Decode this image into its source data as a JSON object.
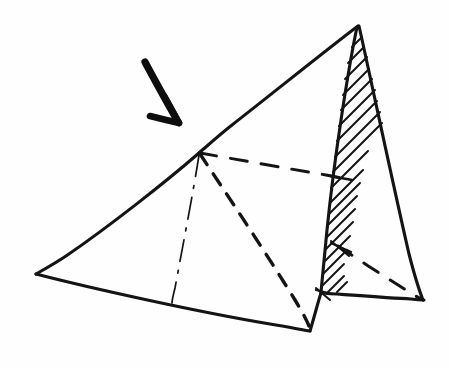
{
  "figure": {
    "background_color": "#fefefe",
    "ink_color": "#141414",
    "width": 449,
    "height": 368,
    "caption": "",
    "annotation_arrow": {
      "name": "pointer-arrow",
      "description": "thick hand-drawn arrow pointing down-right toward the pyramid apex edge",
      "tail_x": 145,
      "tail_y": 62,
      "tip_x": 180,
      "tip_y": 124
    },
    "vertices": {
      "apex": {
        "label": "apex",
        "x": 358,
        "y": 25
      },
      "left": {
        "label": "left-base-corner",
        "x": 36,
        "y": 274
      },
      "front": {
        "label": "front-base-corner",
        "x": 310,
        "y": 331
      },
      "right": {
        "label": "right-base-corner",
        "x": 424,
        "y": 300
      },
      "cut": {
        "label": "cut-point-on-front-edge",
        "x": 199,
        "y": 153
      },
      "hatch_base_left": {
        "label": "hatch-base-left",
        "x": 322,
        "y": 292
      },
      "hatch_mid": {
        "label": "hatch-mid-point",
        "x": 340,
        "y": 247
      }
    },
    "strokes": {
      "solid_edges": [
        {
          "name": "edge-apex-to-cut",
          "d": "M 358 26 C 330 47, 268 97, 232 125 C 218 136, 206 147, 199 153"
        },
        {
          "name": "edge-cut-to-left-base",
          "d": "M 199 153 C 168 180, 110 226, 66 256 C 54 264, 43 270, 36 274"
        },
        {
          "name": "edge-left-base-to-front-base",
          "d": "M 36 274 C 90 288, 198 312, 270 324 C 290 327, 302 330, 310 331"
        },
        {
          "name": "edge-front-base-up-right",
          "d": "M 310 331 C 314 318, 318 302, 321 293"
        },
        {
          "name": "edge-hatch-left-boundary",
          "d": "M 357 27 C 348 70, 334 160, 327 230 C 324 262, 322 283, 321 292"
        },
        {
          "name": "edge-apex-to-right-base",
          "d": "M 359 26 C 368 66, 392 180, 409 254 C 417 285, 421 295, 423 300"
        },
        {
          "name": "edge-base-right-face",
          "d": "M 321 293 C 350 295, 390 298, 411 299 C 418 300, 421 300, 424 300"
        }
      ],
      "dashed_edges": [
        {
          "name": "dashed-cut-plane-horizontal",
          "d": "M 200 153 C 240 160, 290 169, 326 175 C 336 177, 342 178, 348 179",
          "style": "edge-dashed-light"
        },
        {
          "name": "dashed-cut-plane-diagonal",
          "d": "M 200 154 C 226 193, 268 256, 295 300 C 303 313, 307 321, 309 326",
          "style": "edge-dashed"
        },
        {
          "name": "dashed-base-diagonal-right",
          "d": "M 338 246 C 362 262, 396 284, 414 295 C 419 298, 421 299, 423 300",
          "style": "edge-dashed-light"
        }
      ],
      "dashdot_edges": [
        {
          "name": "dashdot-internal-height",
          "d": "M 199 155 C 194 188, 182 250, 175 288 C 173 296, 172 300, 172 303",
          "style": "edge-dashdot"
        }
      ],
      "hatch": {
        "name": "cross-section-hatching",
        "region": "narrow sliver between apex edge and right face",
        "direction": "lower-left to upper-right",
        "line_count": 22,
        "lines": [
          {
            "x1": 352,
            "y1": 47,
            "x2": 362,
            "y2": 37
          },
          {
            "x1": 348,
            "y1": 63,
            "x2": 364,
            "y2": 47
          },
          {
            "x1": 345,
            "y1": 79,
            "x2": 367,
            "y2": 57
          },
          {
            "x1": 343,
            "y1": 95,
            "x2": 369,
            "y2": 69
          },
          {
            "x1": 341,
            "y1": 110,
            "x2": 372,
            "y2": 79
          },
          {
            "x1": 339,
            "y1": 126,
            "x2": 375,
            "y2": 90
          },
          {
            "x1": 337,
            "y1": 141,
            "x2": 377,
            "y2": 101
          },
          {
            "x1": 335,
            "y1": 157,
            "x2": 380,
            "y2": 112
          },
          {
            "x1": 333,
            "y1": 172,
            "x2": 382,
            "y2": 123
          },
          {
            "x1": 331,
            "y1": 188,
            "x2": 368,
            "y2": 151
          },
          {
            "x1": 330,
            "y1": 203,
            "x2": 363,
            "y2": 170
          },
          {
            "x1": 329,
            "y1": 214,
            "x2": 360,
            "y2": 183
          },
          {
            "x1": 327,
            "y1": 226,
            "x2": 357,
            "y2": 196
          },
          {
            "x1": 326,
            "y1": 238,
            "x2": 355,
            "y2": 209
          },
          {
            "x1": 325,
            "y1": 250,
            "x2": 353,
            "y2": 222
          },
          {
            "x1": 324,
            "y1": 262,
            "x2": 350,
            "y2": 236
          },
          {
            "x1": 323,
            "y1": 274,
            "x2": 347,
            "y2": 250
          },
          {
            "x1": 322,
            "y1": 286,
            "x2": 344,
            "y2": 264
          },
          {
            "x1": 328,
            "y1": 292,
            "x2": 344,
            "y2": 276
          },
          {
            "x1": 337,
            "y1": 292,
            "x2": 347,
            "y2": 282
          },
          {
            "x1": 331,
            "y1": 241,
            "x2": 349,
            "y2": 256
          },
          {
            "x1": 316,
            "y1": 288,
            "x2": 330,
            "y2": 300
          }
        ]
      },
      "tick_marks": [
        {
          "name": "tick-hatch-upper",
          "x1": 330,
          "y1": 176,
          "x2": 352,
          "y2": 180
        },
        {
          "name": "tick-hatch-lower",
          "x1": 331,
          "y1": 243,
          "x2": 351,
          "y2": 252
        },
        {
          "name": "tick-base-left",
          "x1": 316,
          "y1": 290,
          "x2": 332,
          "y2": 294
        }
      ]
    }
  }
}
